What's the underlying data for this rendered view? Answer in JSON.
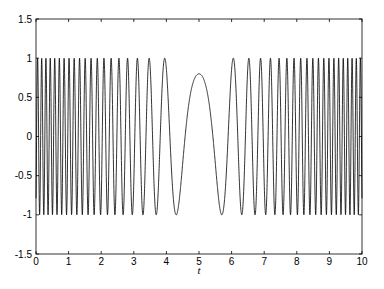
{
  "chart_data": {
    "type": "line",
    "title": "",
    "xlabel": "t",
    "ylabel": "",
    "xlim": [
      0,
      10
    ],
    "ylim": [
      -1.5,
      1.5
    ],
    "grid": false,
    "legend": null,
    "x_ticks": [
      0,
      1,
      2,
      3,
      4,
      5,
      6,
      7,
      8,
      9,
      10
    ],
    "x_tick_labels": [
      "0",
      "1",
      "2",
      "3",
      "4",
      "5",
      "6",
      "7",
      "8",
      "9",
      "10"
    ],
    "y_ticks": [
      1.5,
      1,
      0.5,
      0,
      -0.5,
      -1,
      -1.5
    ],
    "y_tick_labels": [
      "1.5",
      "1",
      "0.5",
      "0",
      "-0.5",
      "-1",
      "-1.5"
    ],
    "series": [
      {
        "name": "chirp",
        "description": "symmetric chirp y = cos(a*(t-5)^2 + phi), oscillating between -1 and 1, slow near t=5 and fast near the edges; value at t=5 is about 0.8",
        "color": "#000000",
        "a": 5.1,
        "phi": 0.6435,
        "center": 5,
        "t_start": 0,
        "t_end": 10,
        "samples": 3000,
        "key_points": [
          {
            "t": 5.0,
            "y": 0.8
          },
          {
            "t": 4.3,
            "y": -1.0
          },
          {
            "t": 5.7,
            "y": -1.0
          },
          {
            "t": 3.95,
            "y": 1.0
          },
          {
            "t": 6.05,
            "y": 1.0
          },
          {
            "t": 3.69,
            "y": -1.0
          },
          {
            "t": 6.31,
            "y": -1.0
          }
        ]
      }
    ]
  }
}
